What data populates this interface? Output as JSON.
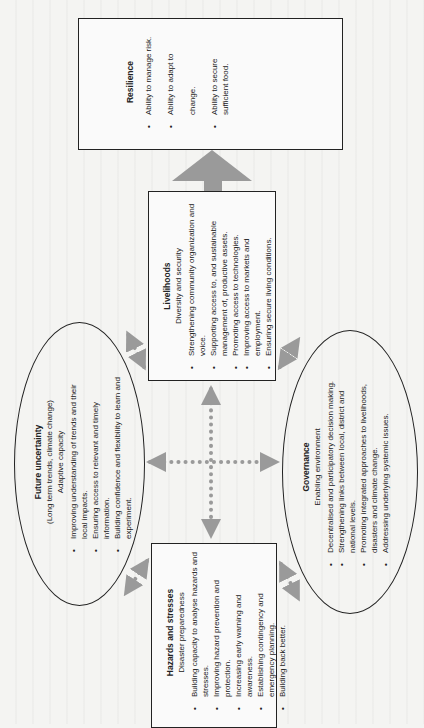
{
  "diagram": {
    "orientation": "rotated-90-ccw",
    "colors": {
      "line": "#222222",
      "arrow": "#9a9a9a",
      "background": "#f4f4f2"
    },
    "nodes": {
      "resilience": {
        "title": "Resilience",
        "items": [
          "Ability to manage risk.",
          "Ability to adapt to change.",
          "Ability to secure sufficient food."
        ]
      },
      "livelihoods": {
        "title": "Livelihoods",
        "subtitle": "Diversity and security",
        "items": [
          "Strengthening community organization and voice.",
          "Supporting access to, and sustainable management of, productive assets.",
          "Promoting access to technologies.",
          "Improving access to markets and employment.",
          "Ensuring secure living conditions."
        ]
      },
      "future_uncertainty": {
        "title": "Future uncertainty",
        "title_note": "(Long term trends, climate change)",
        "subtitle": "Adaptive capacity",
        "items": [
          "Improving understanding of trends and their local impacts.",
          "Ensuring access to relevant and timely information.",
          "Building confidence and flexibility to learn and experiment."
        ]
      },
      "governance": {
        "title": "Governance",
        "subtitle": "Enabling environment",
        "items": [
          "Decentralised and participatory decision making.",
          "Strengthening links between local, district and national levels.",
          "Promoting integrated approaches to livelihoods, disasters and climate change.",
          "Addressing underlying systemic issues."
        ]
      },
      "hazards": {
        "title": "Hazards and stresses",
        "subtitle": "Disaster preparedness",
        "items": [
          "Building capacity to analyse hazards and stresses.",
          "Improving hazard prevention and protection.",
          "Increasing early warning and awareness.",
          "Establishing contingency and emergency planning.",
          "Building back better."
        ]
      }
    },
    "connections": [
      {
        "from": "livelihoods",
        "to": "resilience",
        "style": "solid-large-arrow"
      },
      {
        "from": "livelihoods",
        "to": "future_uncertainty",
        "style": "dotted-double-arrow"
      },
      {
        "from": "livelihoods",
        "to": "governance",
        "style": "dotted-double-arrow"
      },
      {
        "from": "hazards",
        "to": "future_uncertainty",
        "style": "dotted-double-arrow"
      },
      {
        "from": "hazards",
        "to": "governance",
        "style": "dotted-double-arrow"
      },
      {
        "from": "livelihoods",
        "to": "hazards",
        "style": "dotted-double-arrow-cross"
      },
      {
        "from": "future_uncertainty",
        "to": "governance",
        "style": "dotted-double-arrow-cross"
      }
    ]
  }
}
